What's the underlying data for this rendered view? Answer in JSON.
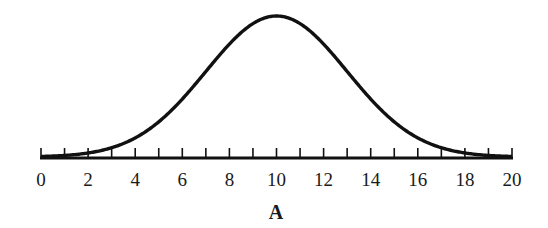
{
  "chart_data": {
    "type": "line",
    "title": "A",
    "xlabel": "A",
    "ylabel": "",
    "xlim": [
      0,
      20
    ],
    "x_tick_labels": [
      "0",
      "2",
      "4",
      "6",
      "8",
      "10",
      "12",
      "14",
      "16",
      "18",
      "20"
    ],
    "minor_ticks_every": 1,
    "grid": false,
    "legend": null,
    "series": [
      {
        "name": "distribution",
        "mean": 10,
        "sd": 3,
        "x": [
          0,
          1,
          2,
          3,
          4,
          5,
          6,
          7,
          8,
          9,
          10,
          11,
          12,
          13,
          14,
          15,
          16,
          17,
          18,
          19,
          20
        ],
        "values": [
          0.004,
          0.012,
          0.029,
          0.066,
          0.135,
          0.249,
          0.411,
          0.607,
          0.801,
          0.946,
          1.0,
          0.946,
          0.801,
          0.607,
          0.411,
          0.249,
          0.135,
          0.066,
          0.029,
          0.012,
          0.004
        ]
      }
    ]
  }
}
